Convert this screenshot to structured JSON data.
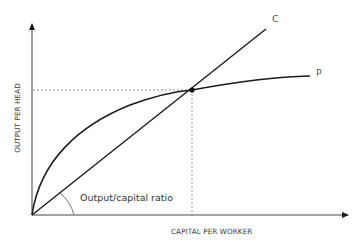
{
  "diagram": {
    "type": "economics-growth-diagram",
    "x_axis": {
      "label": "CAPITAL PER WORKER"
    },
    "y_axis": {
      "label": "OUTPUT PER HEAD"
    },
    "curves": [
      {
        "id": "P",
        "label": "P",
        "description": "production function (diminishing returns)"
      },
      {
        "id": "C",
        "label": "C",
        "description": "straight line from origin (constant output/capital ratio)"
      }
    ],
    "annotations": {
      "angle_label": "Output/capital ratio"
    },
    "colors": {
      "lines": "#1a1a1a",
      "axis": "#444444",
      "dashed": "#777777",
      "text": "#3a3a3a"
    }
  }
}
